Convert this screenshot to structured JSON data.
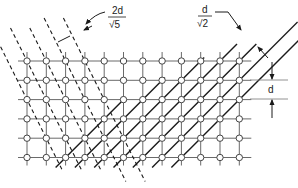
{
  "figure": {
    "type": "lattice-spacing-diagram",
    "grid": {
      "columns": 12,
      "rows": 6,
      "x0": 27,
      "y0": 61,
      "spacing": 19.3,
      "node_radius": 3.2,
      "line_color": "#555555",
      "node_fill": "#ffffff"
    },
    "annotations": {
      "dashed_spacing": {
        "numerator": "2d",
        "denominator": "√5",
        "denominator_symbol": "√",
        "denominator_value": "5"
      },
      "solid_spacing": {
        "numerator": "d",
        "denominator": "√2",
        "denominator_symbol": "√",
        "denominator_value": "2"
      },
      "grid_spacing": {
        "label": "d"
      }
    },
    "colors": {
      "lines": "#1a1a1a",
      "grid": "#666666"
    }
  }
}
